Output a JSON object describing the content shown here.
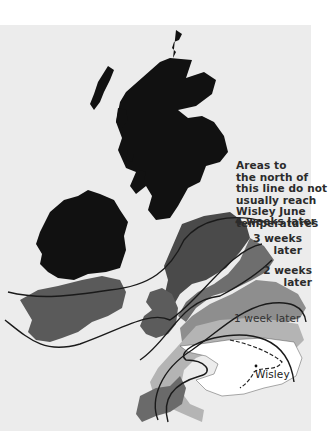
{
  "map": {
    "title": "Flowering delay relative to Wisley (June temperatures)",
    "annotations": {
      "north_line_label": "Areas to the north of this line do not usually reach Wisley June temperatures",
      "north_line_lines": [
        "Areas to",
        "the north of",
        "this line do not",
        "usually reach",
        "Wisley June",
        "temperatures"
      ],
      "four_weeks": "4 weeks later",
      "three_weeks_lines": [
        "3 weeks",
        "later"
      ],
      "two_weeks_lines": [
        "2 weeks",
        "later"
      ],
      "one_week": "1 week later",
      "reference_site": "Wisley"
    },
    "zones": [
      {
        "name": "no-wisley-june-temps",
        "color": "#111111"
      },
      {
        "name": "4-weeks-later",
        "color": "#4a4a4a"
      },
      {
        "name": "3-weeks-later",
        "color": "#6e6e6e"
      },
      {
        "name": "2-weeks-later",
        "color": "#8e8e8e"
      },
      {
        "name": "1-week-later",
        "color": "#b4b4b4"
      },
      {
        "name": "wisley-region",
        "color": "#ffffff"
      }
    ],
    "background_color": "#ececec",
    "line_color": "#1a1a1a"
  }
}
